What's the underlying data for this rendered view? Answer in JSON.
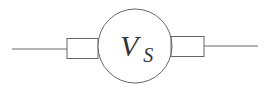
{
  "diagram": {
    "type": "circuit-symbol",
    "component": "voltage-source",
    "label": {
      "main": "V",
      "subscript": "S"
    },
    "colors": {
      "stroke": "#666666",
      "background": "#ffffff",
      "text": "#333333"
    }
  }
}
